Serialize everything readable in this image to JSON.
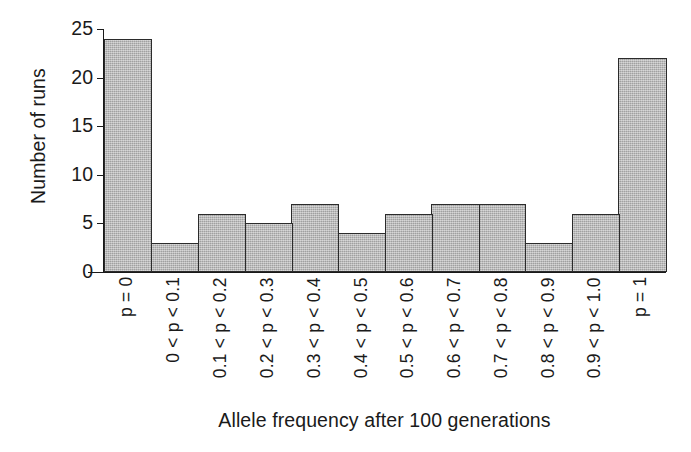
{
  "chart_data": {
    "type": "bar",
    "title": "",
    "subtitle": "",
    "xlabel": "Allele frequency after 100 generations",
    "ylabel": "Number of runs",
    "categories": [
      "p = 0",
      "0 < p < 0.1",
      "0.1 < p < 0.2",
      "0.2 < p < 0.3",
      "0.3 < p < 0.4",
      "0.4 < p < 0.5",
      "0.5 < p < 0.6",
      "0.6 < p < 0.7",
      "0.7 < p < 0.8",
      "0.8 < p < 0.9",
      "0.9 < p < 1.0",
      "p = 1"
    ],
    "values": [
      24,
      3,
      6,
      5,
      7,
      4,
      6,
      7,
      7,
      3,
      6,
      22
    ],
    "ylim": [
      0,
      25
    ],
    "yticks": [
      0,
      5,
      10,
      15,
      20,
      25
    ],
    "ytick_labels": [
      "0",
      "5",
      "10",
      "15",
      "20",
      "25"
    ],
    "grid": false,
    "legend": false,
    "legend_position": "none",
    "bar_fill_color": "#b4b4b4",
    "bar_edge_color": "#2b2b2b",
    "axis_color": "#1a1a1a",
    "background_color": "#ffffff"
  }
}
